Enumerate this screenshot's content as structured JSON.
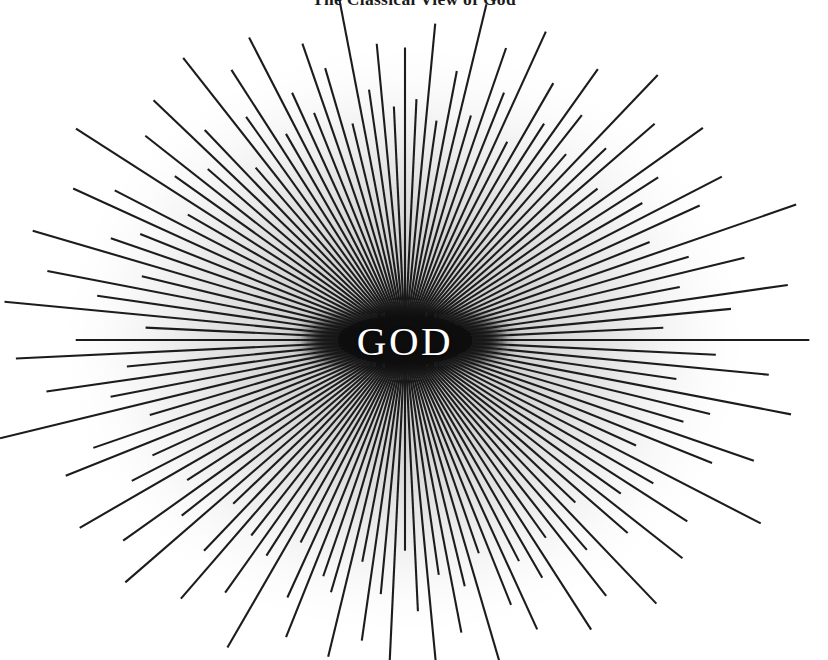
{
  "figure": {
    "title": "The Classical View of God",
    "center_label": "GOD",
    "background_color": "#ffffff",
    "ray_color": "#1c1c1c",
    "core_color": "#141414",
    "glow_color": "#b4b4b4",
    "label_color": "#ffffff",
    "title_color": "#1a1a1a"
  },
  "chart_data": {
    "type": "radial-burst",
    "title": "The Classical View of God",
    "center_label": "GOD",
    "center": {
      "x": 405,
      "y": 340
    },
    "core_ellipse": {
      "cx": 405,
      "cy": 340,
      "rx": 107,
      "ry": 37
    },
    "glow": {
      "cx": 405,
      "cy": 340,
      "rx": 350,
      "ry": 300,
      "color": "#b4b4b4"
    },
    "ray_count": 132,
    "ray_inner_radius": 38,
    "ray_outer_radius_min": 228,
    "ray_outer_radius_max": 392,
    "ray_width": 2.1,
    "ray_color": "#1c1c1c",
    "background": "#ffffff",
    "xlim": [
      0,
      828
    ],
    "ylim": [
      0,
      660
    ],
    "grid": false,
    "legend": false,
    "ray_lengths": [
      318,
      262,
      345,
      240,
      296,
      372,
      251,
      330,
      283,
      358,
      234,
      309,
      266,
      341,
      291,
      248,
      366,
      275,
      324,
      238,
      352,
      287,
      259,
      334,
      301,
      243,
      379,
      269,
      316,
      252,
      347,
      293,
      231,
      361,
      278,
      327,
      246,
      354,
      284,
      264,
      338,
      305,
      236,
      375,
      271,
      320,
      255,
      343,
      289,
      233,
      364,
      280,
      331,
      249,
      356,
      286,
      261,
      336,
      303,
      241,
      381,
      273,
      322,
      257,
      349,
      295,
      229,
      359,
      277,
      329,
      244,
      351,
      282,
      267,
      340,
      299,
      239,
      370,
      265,
      318,
      253,
      345,
      291,
      235,
      363,
      276,
      333,
      247,
      355,
      288,
      258,
      337,
      302,
      242,
      377,
      270,
      325,
      250,
      348,
      294,
      232,
      360,
      279,
      328,
      245,
      353,
      285,
      263,
      339,
      306,
      237,
      373,
      272,
      321,
      256,
      344,
      290,
      230,
      365,
      281,
      332,
      248,
      357,
      287,
      260,
      335,
      304,
      240,
      392,
      274,
      323,
      254
    ]
  }
}
